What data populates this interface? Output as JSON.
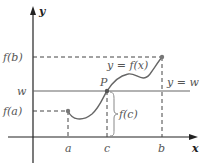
{
  "figure": {
    "type": "Intermediate Value Theorem illustration",
    "axes": {
      "x_label": "x",
      "y_label": "y"
    },
    "y_ticks": {
      "fb": "f(b)",
      "w": "w",
      "fa": "f(a)"
    },
    "x_ticks": {
      "a": "a",
      "c": "c",
      "b": "b"
    },
    "curve_label": "y = f(x)",
    "line_label": "y = w",
    "point_label": "P",
    "brace_label": "f(c)",
    "colors": {
      "axis": "#222222",
      "curve": "#666666",
      "dashed": "#444444",
      "text": "#555555"
    }
  }
}
